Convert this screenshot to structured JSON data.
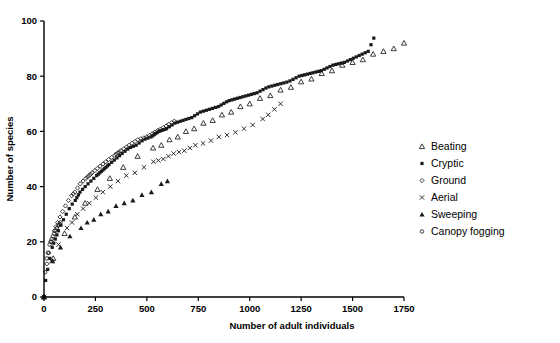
{
  "chart_data": {
    "type": "scatter",
    "title": "",
    "subtitle": "",
    "xlabel": "Number of adult individuals",
    "ylabel": "Number of species",
    "xlim": [
      0,
      1750
    ],
    "ylim": [
      0,
      100
    ],
    "xticks": [
      0,
      250,
      500,
      750,
      1000,
      1250,
      1500,
      1750
    ],
    "yticks": [
      0,
      20,
      40,
      60,
      80,
      100
    ],
    "xtick_labels": [
      "0",
      "250",
      "500",
      "750",
      "1000",
      "1250",
      "1500",
      "1750"
    ],
    "ytick_labels": [
      "0",
      "20",
      "40",
      "60",
      "80",
      "100"
    ],
    "grid": false,
    "legend_position": "right",
    "annotations": [],
    "series": [
      {
        "name": "Beating",
        "marker": "open-triangle",
        "color": "#1a1a1a",
        "points": [
          [
            0,
            0
          ],
          [
            15,
            7
          ],
          [
            30,
            11
          ],
          [
            45,
            14
          ],
          [
            60,
            17
          ],
          [
            80,
            20
          ],
          [
            100,
            23
          ],
          [
            125,
            26
          ],
          [
            150,
            29
          ],
          [
            175,
            32
          ],
          [
            200,
            34
          ],
          [
            230,
            37
          ],
          [
            260,
            39
          ],
          [
            290,
            41
          ],
          [
            320,
            43
          ],
          [
            350,
            45
          ],
          [
            385,
            47
          ],
          [
            420,
            49
          ],
          [
            455,
            51
          ],
          [
            490,
            52
          ],
          [
            530,
            54
          ],
          [
            570,
            55
          ],
          [
            610,
            57
          ],
          [
            650,
            58
          ],
          [
            690,
            60
          ],
          [
            730,
            61
          ],
          [
            775,
            63
          ],
          [
            820,
            64
          ],
          [
            865,
            66
          ],
          [
            910,
            67
          ],
          [
            955,
            69
          ],
          [
            1000,
            70
          ],
          [
            1050,
            72
          ],
          [
            1100,
            73
          ],
          [
            1150,
            75
          ],
          [
            1200,
            76
          ],
          [
            1250,
            78
          ],
          [
            1300,
            79
          ],
          [
            1350,
            81
          ],
          [
            1400,
            82
          ],
          [
            1450,
            84
          ],
          [
            1500,
            85
          ],
          [
            1550,
            86
          ],
          [
            1600,
            88
          ],
          [
            1650,
            89
          ],
          [
            1700,
            90
          ],
          [
            1750,
            92
          ]
        ]
      },
      {
        "name": "Cryptic",
        "marker": "filled-square",
        "color": "#1a1a1a",
        "points": [
          [
            0,
            0
          ],
          [
            8,
            6
          ],
          [
            18,
            10
          ],
          [
            28,
            14
          ],
          [
            40,
            18
          ],
          [
            55,
            21
          ],
          [
            70,
            24
          ],
          [
            88,
            27
          ],
          [
            108,
            30
          ],
          [
            130,
            33
          ],
          [
            152,
            35
          ],
          [
            175,
            38
          ],
          [
            200,
            40
          ],
          [
            228,
            42
          ],
          [
            256,
            44
          ],
          [
            286,
            46
          ],
          [
            316,
            48
          ],
          [
            348,
            50
          ],
          [
            380,
            52
          ],
          [
            414,
            54
          ],
          [
            448,
            55
          ],
          [
            484,
            57
          ],
          [
            520,
            58
          ],
          [
            558,
            60
          ],
          [
            596,
            61
          ],
          [
            636,
            63
          ],
          [
            676,
            64
          ],
          [
            718,
            65
          ],
          [
            760,
            67
          ],
          [
            804,
            68
          ],
          [
            848,
            69
          ],
          [
            894,
            71
          ],
          [
            940,
            72
          ],
          [
            988,
            73
          ],
          [
            1036,
            74
          ],
          [
            1086,
            76
          ],
          [
            1136,
            77
          ],
          [
            1188,
            78
          ],
          [
            1240,
            80
          ],
          [
            1294,
            81
          ],
          [
            1348,
            82
          ],
          [
            1404,
            84
          ],
          [
            1460,
            85
          ],
          [
            1518,
            87
          ],
          [
            1576,
            89
          ],
          [
            1610,
            95
          ]
        ]
      },
      {
        "name": "Ground",
        "marker": "open-diamond",
        "color": "#1a1a1a",
        "points": [
          [
            0,
            0
          ],
          [
            6,
            7
          ],
          [
            14,
            12
          ],
          [
            24,
            16
          ],
          [
            36,
            20
          ],
          [
            50,
            24
          ],
          [
            66,
            27
          ],
          [
            84,
            30
          ],
          [
            104,
            33
          ],
          [
            126,
            36
          ],
          [
            150,
            38
          ],
          [
            176,
            41
          ],
          [
            204,
            43
          ],
          [
            234,
            45
          ],
          [
            266,
            47
          ],
          [
            300,
            49
          ],
          [
            336,
            51
          ],
          [
            374,
            53
          ],
          [
            414,
            55
          ],
          [
            456,
            57
          ],
          [
            500,
            58
          ],
          [
            546,
            60
          ],
          [
            594,
            62
          ],
          [
            640,
            64
          ]
        ]
      },
      {
        "name": "Aerial",
        "marker": "cross",
        "color": "#1a1a1a",
        "points": [
          [
            0,
            0
          ],
          [
            10,
            5
          ],
          [
            22,
            9
          ],
          [
            36,
            13
          ],
          [
            52,
            16
          ],
          [
            70,
            19
          ],
          [
            90,
            22
          ],
          [
            112,
            25
          ],
          [
            136,
            27
          ],
          [
            162,
            30
          ],
          [
            190,
            32
          ],
          [
            220,
            34
          ],
          [
            252,
            36
          ],
          [
            286,
            38
          ],
          [
            322,
            40
          ],
          [
            360,
            42
          ],
          [
            400,
            44
          ],
          [
            442,
            45
          ],
          [
            486,
            47
          ],
          [
            532,
            49
          ],
          [
            580,
            50
          ],
          [
            630,
            52
          ],
          [
            682,
            53
          ],
          [
            736,
            55
          ],
          [
            792,
            56
          ],
          [
            850,
            58
          ],
          [
            910,
            59
          ],
          [
            972,
            61
          ],
          [
            1036,
            63
          ],
          [
            1090,
            66
          ],
          [
            1120,
            68
          ],
          [
            1150,
            70
          ]
        ]
      },
      {
        "name": "Sweeping",
        "marker": "filled-triangle",
        "color": "#1a1a1a",
        "points": [
          [
            0,
            0
          ],
          [
            12,
            6
          ],
          [
            26,
            10
          ],
          [
            42,
            13
          ],
          [
            60,
            16
          ],
          [
            80,
            18
          ],
          [
            102,
            20
          ],
          [
            126,
            22
          ],
          [
            152,
            24
          ],
          [
            180,
            25
          ],
          [
            210,
            27
          ],
          [
            242,
            28
          ],
          [
            276,
            30
          ],
          [
            312,
            31
          ],
          [
            350,
            33
          ],
          [
            390,
            34
          ],
          [
            432,
            35
          ],
          [
            476,
            37
          ],
          [
            522,
            38
          ],
          [
            548,
            40
          ],
          [
            570,
            41
          ],
          [
            600,
            42
          ]
        ]
      },
      {
        "name": "Canopy fogging",
        "marker": "open-circle",
        "color": "#1a1a1a",
        "points": [
          [
            0,
            0
          ],
          [
            1,
            3
          ],
          [
            2,
            5
          ],
          [
            3,
            6
          ],
          [
            4,
            8
          ],
          [
            6,
            9
          ],
          [
            8,
            11
          ],
          [
            10,
            12
          ],
          [
            13,
            14
          ],
          [
            16,
            15
          ],
          [
            19,
            16
          ],
          [
            23,
            18
          ],
          [
            27,
            19
          ],
          [
            32,
            20
          ],
          [
            37,
            21
          ],
          [
            43,
            22
          ],
          [
            49,
            23
          ],
          [
            56,
            24
          ],
          [
            63,
            25
          ],
          [
            71,
            26
          ],
          [
            80,
            27
          ]
        ]
      }
    ]
  },
  "legend": {
    "items": [
      {
        "label": "Beating",
        "marker": "open-triangle"
      },
      {
        "label": "Cryptic",
        "marker": "filled-square"
      },
      {
        "label": "Ground",
        "marker": "open-diamond"
      },
      {
        "label": "Aerial",
        "marker": "cross"
      },
      {
        "label": "Sweeping",
        "marker": "filled-triangle"
      },
      {
        "label": "Canopy fogging",
        "marker": "open-circle"
      }
    ]
  },
  "colors": {
    "ink": "#1a1a1a",
    "axis": "#000000",
    "background": "#ffffff"
  }
}
